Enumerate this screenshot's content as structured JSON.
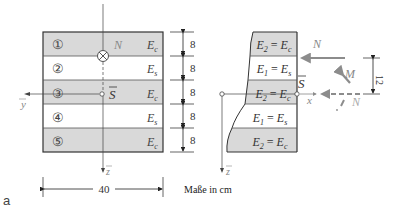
{
  "figure": {
    "panel_label": "a",
    "units_note": "Maße in cm",
    "colors": {
      "concrete_fill": "#d9d9d9",
      "steel_fill": "#ffffff",
      "line": "#333333",
      "force_arrow": "#8c8c8c",
      "dim_line": "#222222"
    }
  },
  "cross_section": {
    "layers": [
      {
        "number": "①",
        "material": "E",
        "sub": "c"
      },
      {
        "number": "②",
        "material": "E",
        "sub": "s"
      },
      {
        "number": "③",
        "material": "E",
        "sub": "c"
      },
      {
        "number": "④",
        "material": "E",
        "sub": "s"
      },
      {
        "number": "⑤",
        "material": "E",
        "sub": "c"
      }
    ],
    "layer_heights": [
      "8",
      "8",
      "8",
      "8",
      "8"
    ],
    "width_dim": "40",
    "force_label": "N",
    "centroid_label": "S",
    "y_axis_label": "y",
    "z_axis_label": "z"
  },
  "side_view": {
    "layers": [
      {
        "lhs": "E",
        "lhs_sub": "2",
        "rhs": "E",
        "rhs_sub": "c"
      },
      {
        "lhs": "E",
        "lhs_sub": "1",
        "rhs": "E",
        "rhs_sub": "s"
      },
      {
        "lhs": "E",
        "lhs_sub": "2",
        "rhs": "E",
        "rhs_sub": "c"
      },
      {
        "lhs": "E",
        "lhs_sub": "1",
        "rhs": "E",
        "rhs_sub": "s"
      },
      {
        "lhs": "E",
        "lhs_sub": "2",
        "rhs": "E",
        "rhs_sub": "c"
      }
    ],
    "eq_sign": "=",
    "force_top_label": "N",
    "moment_label": "M",
    "force_centroid_label": "N",
    "eccentricity_dim": "12",
    "centroid_label": "S",
    "x_axis_label": "x",
    "z_axis_label": "z"
  }
}
